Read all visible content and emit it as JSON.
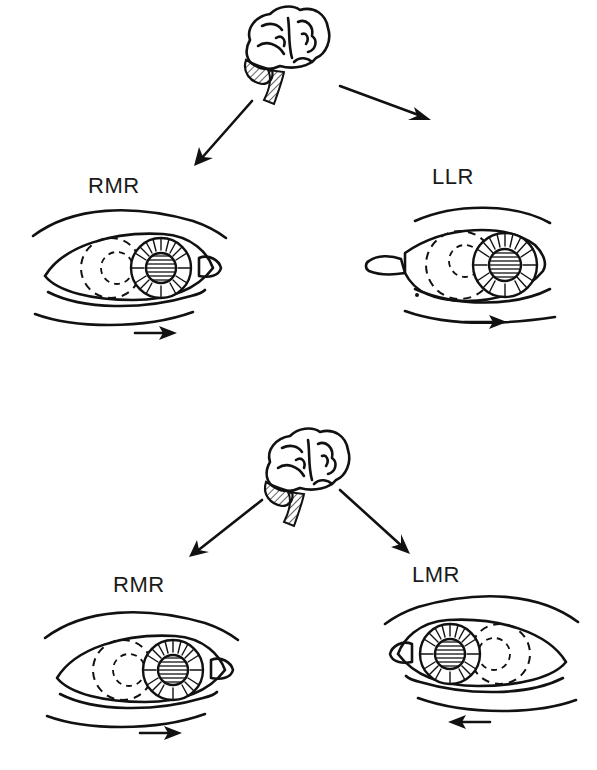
{
  "figure": {
    "panels": [
      {
        "id": "top",
        "description": "Brain signals rightward gaze: right medial rectus and left lateral rectus",
        "left_eye_label": "RMR",
        "right_eye_label": "LLR",
        "left_eye_movement": "right",
        "right_eye_movement": "right"
      },
      {
        "id": "bottom",
        "description": "Brain signals convergence: right medial rectus and left medial rectus",
        "left_eye_label": "RMR",
        "right_eye_label": "LMR",
        "left_eye_movement": "right",
        "right_eye_movement": "left"
      }
    ]
  },
  "colors": {
    "ink": "#111111",
    "background": "#ffffff"
  }
}
